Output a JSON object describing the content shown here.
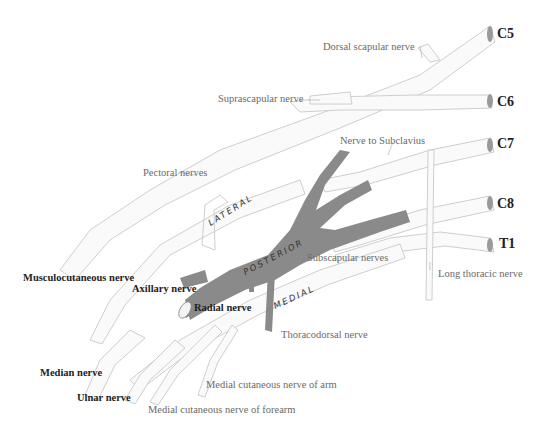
{
  "diagram": {
    "roots": [
      {
        "label": "C5",
        "x": 497,
        "y": 26
      },
      {
        "label": "C6",
        "x": 497,
        "y": 94
      },
      {
        "label": "C7",
        "x": 497,
        "y": 136
      },
      {
        "label": "C8",
        "x": 497,
        "y": 196
      },
      {
        "label": "T1",
        "x": 499,
        "y": 236
      }
    ],
    "cords": [
      {
        "label": "LATERAL",
        "x": 208,
        "y": 214,
        "rotate": -32
      },
      {
        "label": "POSTERIOR",
        "x": 245,
        "y": 262,
        "rotate": -28
      },
      {
        "label": "MEDIAL",
        "x": 273,
        "y": 296,
        "rotate": -25
      }
    ],
    "labels": {
      "dorsal_scapular": "Dorsal scapular nerve",
      "suprascapular": "Suprascapular nerve",
      "nerve_to_subclavius": "Nerve to Subclavius",
      "pectoral": "Pectoral nerves",
      "subscapular": "Subscapular nerves",
      "long_thoracic": "Long thoracic nerve",
      "musculocutaneous": "Musculocutaneous nerve",
      "axillary": "Axillary nerve",
      "radial": "Radial nerve",
      "thoracodorsal": "Thoracodorsal nerve",
      "median": "Median nerve",
      "ulnar": "Ulnar nerve",
      "medial_cut_arm": "Medial cutaneous nerve of arm",
      "medial_cut_forearm": "Medial cutaneous nerve of forearm"
    },
    "colors": {
      "nerve_fill": "#fafafa",
      "nerve_outline": "#c8c8c8",
      "posterior_cord": "#8a8a8a",
      "root_end": "#9a9a9a"
    }
  }
}
